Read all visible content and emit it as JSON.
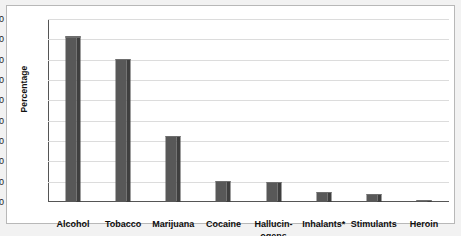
{
  "chart_data": {
    "type": "bar",
    "title": "",
    "xlabel": "",
    "ylabel": "Percentage",
    "categories": [
      "Alcohol",
      "Tobacco",
      "Marijuana",
      "Cocaine",
      "Hallucin-\nogens",
      "Inhalants*",
      "Stimulants",
      "Heroin"
    ],
    "values": [
      81.5,
      70.5,
      32.5,
      10.5,
      10,
      5,
      4,
      1
    ],
    "ylim": [
      0,
      90
    ],
    "yticks": [
      0,
      10,
      20,
      30,
      40,
      50,
      60,
      70,
      80,
      90
    ],
    "ytick_labels": [
      "0",
      "10",
      "20",
      "30",
      "40",
      "50",
      "60",
      "70",
      "80",
      "90"
    ],
    "grid": true,
    "legend": false,
    "bar_color": "#585858",
    "bar_side_color": "#3f3f3f",
    "grid_color": "#dcdcdc",
    "axis_color": "#555555",
    "background": "#ffffff"
  }
}
